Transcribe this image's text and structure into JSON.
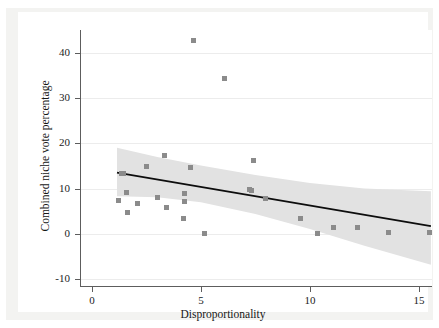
{
  "figure": {
    "background_color": "#ffffff",
    "paper_color": "#f3f3f1",
    "top_bleed_text": "",
    "marker_color": "#8b8b8b",
    "band_color": "#e2e2e2",
    "line_color": "#0d0d0d",
    "grid_color": "#ececec",
    "axis_color": "#5d5d5d"
  },
  "chart_data": {
    "type": "scatter",
    "title": "",
    "xlabel": "Disproportionality",
    "ylabel": "Combined niche vote percentage",
    "xlim": [
      -0.5,
      15.6
    ],
    "ylim": [
      -11.5,
      45.0
    ],
    "xticks": [
      0,
      5,
      10,
      15
    ],
    "xticklabels": [
      "0",
      "5",
      "10",
      "15"
    ],
    "yticks": [
      -10,
      0,
      10,
      20,
      30,
      40
    ],
    "yticklabels": [
      "-10",
      "0",
      "10",
      "20",
      "30",
      "40"
    ],
    "grid": "horizontal",
    "legend": "none",
    "points": [
      {
        "x": 1.2,
        "y": 7.3
      },
      {
        "x": 1.35,
        "y": 13.4
      },
      {
        "x": 1.45,
        "y": 13.3
      },
      {
        "x": 1.6,
        "y": 9.1
      },
      {
        "x": 1.65,
        "y": 4.8
      },
      {
        "x": 2.1,
        "y": 6.7
      },
      {
        "x": 2.5,
        "y": 14.9
      },
      {
        "x": 3.0,
        "y": 8.0
      },
      {
        "x": 3.35,
        "y": 17.4
      },
      {
        "x": 3.4,
        "y": 5.9
      },
      {
        "x": 4.2,
        "y": 3.4
      },
      {
        "x": 4.25,
        "y": 9.0
      },
      {
        "x": 4.25,
        "y": 7.2
      },
      {
        "x": 4.5,
        "y": 14.6
      },
      {
        "x": 4.65,
        "y": 42.7
      },
      {
        "x": 5.15,
        "y": 0.1
      },
      {
        "x": 6.1,
        "y": 34.4
      },
      {
        "x": 7.25,
        "y": 9.9
      },
      {
        "x": 7.3,
        "y": 9.5
      },
      {
        "x": 7.4,
        "y": 16.3
      },
      {
        "x": 7.95,
        "y": 7.9
      },
      {
        "x": 9.55,
        "y": 3.5
      },
      {
        "x": 10.35,
        "y": 0.1
      },
      {
        "x": 11.1,
        "y": 1.4
      },
      {
        "x": 12.2,
        "y": 1.5
      },
      {
        "x": 13.6,
        "y": 0.2
      },
      {
        "x": 15.5,
        "y": 0.3
      }
    ],
    "fit_line": {
      "type": "linear_regression",
      "x_start": 1.15,
      "y_start": 13.5,
      "x_end": 15.55,
      "y_end": 1.7,
      "slope": -0.82,
      "intercept": 14.44
    },
    "confidence_band": {
      "label": "95% confidence interval",
      "upper": [
        {
          "x": 1.15,
          "y": 19.0
        },
        {
          "x": 3.0,
          "y": 17.0
        },
        {
          "x": 5.0,
          "y": 15.1
        },
        {
          "x": 7.5,
          "y": 13.0
        },
        {
          "x": 10.0,
          "y": 11.2
        },
        {
          "x": 12.5,
          "y": 10.0
        },
        {
          "x": 15.55,
          "y": 9.4
        }
      ],
      "lower": [
        {
          "x": 1.15,
          "y": 8.3
        },
        {
          "x": 3.0,
          "y": 8.1
        },
        {
          "x": 5.0,
          "y": 7.0
        },
        {
          "x": 7.5,
          "y": 4.4
        },
        {
          "x": 10.0,
          "y": 1.1
        },
        {
          "x": 12.5,
          "y": -2.6
        },
        {
          "x": 15.55,
          "y": -6.8
        }
      ]
    }
  }
}
